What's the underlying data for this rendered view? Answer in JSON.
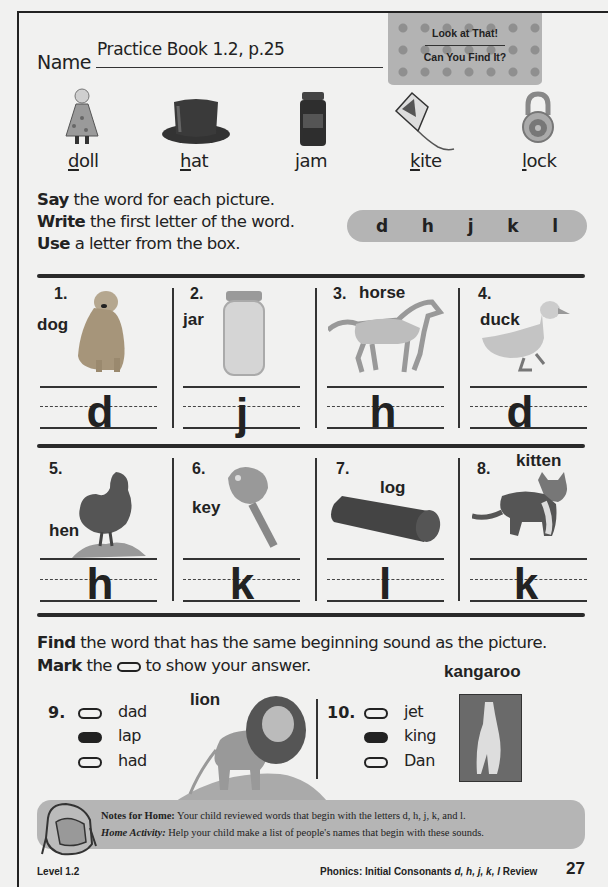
{
  "header": {
    "name_label": "Name",
    "name_value": "Practice Book 1.2, p.25",
    "banner_line1": "Look at That!",
    "banner_line2": "Can You Find It?"
  },
  "picture_key": [
    {
      "first": "d",
      "rest": "oll",
      "icon": "doll-icon"
    },
    {
      "first": "h",
      "rest": "at",
      "icon": "hat-icon"
    },
    {
      "first": "j",
      "rest": "am",
      "icon": "jam-jar-icon"
    },
    {
      "first": "k",
      "rest": "ite",
      "icon": "kite-icon"
    },
    {
      "first": "l",
      "rest": "ock",
      "icon": "lock-icon"
    }
  ],
  "instructions": {
    "line1_bold": "Say",
    "line1_rest": " the word for each picture.",
    "line2_bold": "Write",
    "line2_rest": " the first letter of the word.",
    "line3_bold": "Use",
    "line3_rest": " a letter from the box."
  },
  "letter_box": [
    "d",
    "h",
    "j",
    "k",
    "l"
  ],
  "exercises": [
    {
      "num": "1.",
      "word": "dog",
      "answer": "d",
      "icon": "dog-icon"
    },
    {
      "num": "2.",
      "word": "jar",
      "answer": "j",
      "icon": "jar-icon"
    },
    {
      "num": "3.",
      "word": "horse",
      "answer": "h",
      "icon": "horse-icon"
    },
    {
      "num": "4.",
      "word": "duck",
      "answer": "d",
      "icon": "duck-icon"
    },
    {
      "num": "5.",
      "word": "hen",
      "answer": "h",
      "icon": "hen-icon"
    },
    {
      "num": "6.",
      "word": "key",
      "answer": "k",
      "icon": "key-icon"
    },
    {
      "num": "7.",
      "word": "log",
      "answer": "l",
      "icon": "log-icon"
    },
    {
      "num": "8.",
      "word": "kitten",
      "answer": "k",
      "icon": "kitten-icon"
    }
  ],
  "find_section": {
    "line1_bold": "Find",
    "line1_rest": " the word that has the same beginning sound as the picture.",
    "line2_bold": "Mark",
    "line2_pre": " the ",
    "line2_post": " to show your answer."
  },
  "questions": [
    {
      "num": "9.",
      "picture_word": "lion",
      "options": [
        {
          "label": "dad",
          "selected": false
        },
        {
          "label": "lap",
          "selected": true
        },
        {
          "label": "had",
          "selected": false
        }
      ]
    },
    {
      "num": "10.",
      "picture_word": "kangaroo",
      "options": [
        {
          "label": "jet",
          "selected": false
        },
        {
          "label": "king",
          "selected": true
        },
        {
          "label": "Dan",
          "selected": false
        }
      ]
    }
  ],
  "notes": {
    "title": "Notes for Home:",
    "line1": " Your child reviewed words that begin with the letters d, h, j, k, and l.",
    "activity_title": "Home Activity:",
    "line2": " Help your child make a list of people's names that begin with these sounds."
  },
  "footer": {
    "level": "Level 1.2",
    "topic_prefix": "Phonics: Initial Consonants ",
    "topic_letters": "d, h, j, k, l",
    "topic_suffix": " Review",
    "page_number": "27"
  },
  "colors": {
    "ink": "#222222",
    "paper": "#f1f1f0",
    "gray_box": "#b4b4b4"
  }
}
